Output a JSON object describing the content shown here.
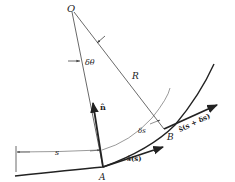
{
  "figure": {
    "type": "geometry-diagram",
    "points": {
      "O": {
        "label": "O",
        "x": 72,
        "y": 10
      },
      "A": {
        "label": "A",
        "x": 103,
        "y": 167
      },
      "B": {
        "label": "B",
        "x": 164,
        "y": 129
      }
    },
    "labels": {
      "center": "O",
      "angle": "δθ",
      "radius": "R",
      "normal": "n̂",
      "arc_length": "s",
      "arc_increment": "δs",
      "point_a": "A",
      "point_b": "B",
      "tangent_at_a": "ŝ(s)",
      "tangent_at_b": "ŝ(s + δs)"
    },
    "colors": {
      "stroke": "#222222",
      "thin_stroke": "#555555",
      "background": "#ffffff"
    }
  }
}
